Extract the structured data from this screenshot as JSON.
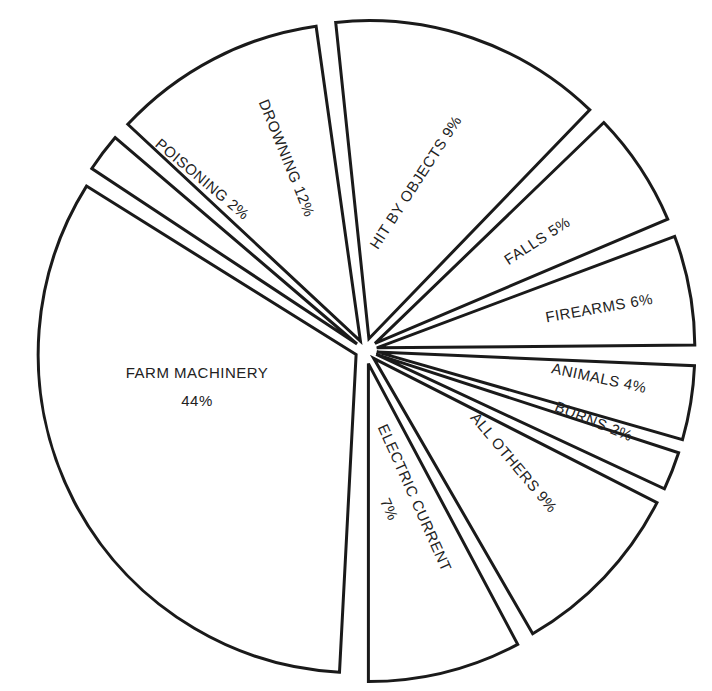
{
  "chart_data": {
    "type": "pie",
    "title": "",
    "exploded": true,
    "stroke_color": "#1a1a1a",
    "fill_color": "#ffffff",
    "text_color": "#222222",
    "center": [
      365,
      350
    ],
    "radius": 318,
    "slices": [
      {
        "label": "FARM MACHINERY",
        "value": 44,
        "display": "44%",
        "start_deg": 93,
        "end_deg": 212,
        "gap": 10,
        "label_pos": [
          197,
          378
        ],
        "label_rot": 0,
        "two_line": true
      },
      {
        "label": "POISONING",
        "value": 2,
        "display": "2%",
        "start_deg": 213.5,
        "end_deg": 220.5,
        "gap": 10,
        "label_pos": [
          199,
          183
        ],
        "label_rot": 40,
        "two_line": false
      },
      {
        "label": "DROWNING",
        "value": 12,
        "display": "12%",
        "start_deg": 223,
        "end_deg": 262,
        "gap": 10,
        "label_pos": [
          282,
          160
        ],
        "label_rot": 68,
        "two_line": false
      },
      {
        "label": "HIT BY OBJECTS",
        "value": 9,
        "display": "9%",
        "start_deg": 264,
        "end_deg": 314,
        "gap": 12,
        "label_pos": [
          420,
          185
        ],
        "label_rot": -57,
        "two_line": false
      },
      {
        "label": "FALLS",
        "value": 5,
        "display": "5%",
        "start_deg": 316,
        "end_deg": 337,
        "gap": 12,
        "label_pos": [
          540,
          245
        ],
        "label_rot": -33,
        "two_line": false
      },
      {
        "label": "FIREARMS",
        "value": 6,
        "display": "6%",
        "start_deg": 339.5,
        "end_deg": 359.5,
        "gap": 12,
        "label_pos": [
          600,
          313
        ],
        "label_rot": -10,
        "two_line": false
      },
      {
        "label": "ANIMALS",
        "value": 4,
        "display": "4%",
        "start_deg": 2.5,
        "end_deg": 16,
        "gap": 12,
        "label_pos": [
          598,
          383
        ],
        "label_rot": 12,
        "two_line": false
      },
      {
        "label": "BURNS",
        "value": 2,
        "display": "2%",
        "start_deg": 18,
        "end_deg": 25,
        "gap": 12,
        "label_pos": [
          592,
          426
        ],
        "label_rot": 22,
        "two_line": false
      },
      {
        "label": "ALL OTHERS",
        "value": 9,
        "display": "9%",
        "start_deg": 27,
        "end_deg": 60,
        "gap": 12,
        "label_pos": [
          510,
          466
        ],
        "label_rot": 50,
        "two_line": false
      },
      {
        "label": "ELECTRIC CURRENT",
        "value": 7,
        "display": "7%",
        "start_deg": 62,
        "end_deg": 90,
        "gap": 14,
        "label_pos": [
          410,
          500
        ],
        "label_rot": 66,
        "two_line": true
      }
    ]
  }
}
